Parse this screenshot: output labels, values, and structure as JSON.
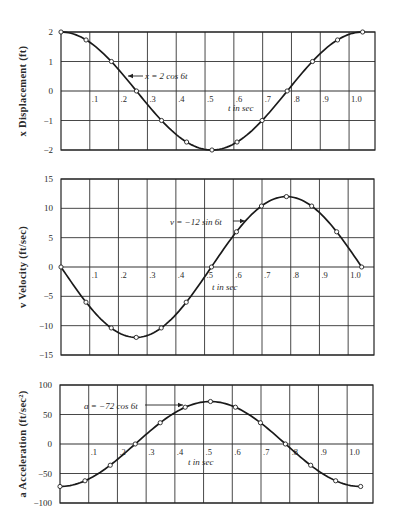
{
  "chart_data": [
    {
      "type": "line",
      "title": "",
      "xlabel": "t in sec",
      "ylabel": "x  Displacement  (ft)",
      "equation": "x = 2 cos 6t",
      "xlim": [
        0,
        1.09
      ],
      "ylim": [
        -2,
        2
      ],
      "x_ticks": [
        ".1",
        ".2",
        ".3",
        ".4",
        ".5",
        ".6",
        ".7",
        ".8",
        ".9",
        "1.0"
      ],
      "y_ticks": [
        "2",
        "1",
        "0",
        "−1",
        "−2"
      ],
      "y_tick_values": [
        2,
        1,
        0,
        -1,
        -2
      ],
      "grid": true,
      "series": [
        {
          "name": "x = 2 cos 6t",
          "x": [
            0,
            0.087,
            0.175,
            0.262,
            0.349,
            0.436,
            0.524,
            0.611,
            0.698,
            0.785,
            0.873,
            0.96,
            1.047
          ],
          "y": [
            2.0,
            1.73,
            1.0,
            0.0,
            -1.0,
            -1.73,
            -2.0,
            -1.73,
            -1.0,
            0.0,
            1.0,
            1.73,
            2.0
          ]
        }
      ],
      "annotation": {
        "text": "x = 2 cos 6t",
        "arrow_to_t": 0.22
      }
    },
    {
      "type": "line",
      "title": "",
      "xlabel": "t in sec",
      "ylabel": "v  Velocity  (ft/sec)",
      "equation": "v = −12 sin 6t",
      "xlim": [
        0,
        1.09
      ],
      "ylim": [
        -15,
        15
      ],
      "x_ticks": [
        ".1",
        ".2",
        ".3",
        ".4",
        ".5",
        ".6",
        ".7",
        ".8",
        ".9",
        "1.0"
      ],
      "y_ticks": [
        "15",
        "10",
        "5",
        "0",
        "−5",
        "−10",
        "−15"
      ],
      "y_tick_values": [
        15,
        10,
        5,
        0,
        -5,
        -10,
        -15
      ],
      "grid": true,
      "series": [
        {
          "name": "v = −12 sin 6t",
          "x": [
            0,
            0.087,
            0.175,
            0.262,
            0.349,
            0.436,
            0.524,
            0.611,
            0.698,
            0.785,
            0.873,
            0.96,
            1.047
          ],
          "y": [
            0.0,
            -6.0,
            -10.39,
            -12.0,
            -10.39,
            -6.0,
            0.0,
            6.0,
            10.39,
            12.0,
            10.39,
            6.0,
            0.0
          ]
        }
      ],
      "annotation": {
        "text": "v = −12 sin 6t",
        "arrow_to_t": 0.6
      }
    },
    {
      "type": "line",
      "title": "",
      "xlabel": "t in sec",
      "ylabel": "a  Acceleration  (ft/sec²)",
      "equation": "a = −72 cos 6t",
      "xlim": [
        0,
        1.09
      ],
      "ylim": [
        -100,
        100
      ],
      "x_ticks": [
        ".1",
        ".2",
        ".3",
        ".4",
        ".5",
        ".6",
        ".7",
        ".8",
        ".9",
        "1.0"
      ],
      "y_ticks": [
        "100",
        "50",
        "0",
        "−50",
        "−100"
      ],
      "y_tick_values": [
        100,
        50,
        0,
        -50,
        -100
      ],
      "grid": true,
      "series": [
        {
          "name": "a = −72 cos 6t",
          "x": [
            0,
            0.087,
            0.175,
            0.262,
            0.349,
            0.436,
            0.524,
            0.611,
            0.698,
            0.785,
            0.873,
            0.96,
            1.047
          ],
          "y": [
            -72.0,
            -62.35,
            -36.0,
            0.0,
            36.0,
            62.35,
            72.0,
            62.35,
            36.0,
            0.0,
            -36.0,
            -62.35,
            -72.0
          ]
        }
      ],
      "annotation": {
        "text": "a = −72 cos 6t",
        "arrow_to_t": 0.43
      }
    }
  ],
  "panels": [
    {
      "id": "displacement",
      "frame": {
        "left": 61,
        "top": 32,
        "right": 375,
        "bottom": 150
      },
      "xlabel_pos": {
        "x": 228,
        "y": 111
      },
      "anno_pos": {
        "x": 145,
        "y": 79,
        "arrow_from": 143,
        "arrow_to": 128,
        "arrow_y": 76
      }
    },
    {
      "id": "velocity",
      "frame": {
        "left": 61,
        "top": 179,
        "right": 374,
        "bottom": 355
      },
      "xlabel_pos": {
        "x": 212,
        "y": 290
      },
      "anno_pos": {
        "x": 170,
        "y": 225,
        "arrow_from": 233,
        "arrow_to": 245,
        "arrow_y": 221
      }
    },
    {
      "id": "acceleration",
      "frame": {
        "left": 60,
        "top": 385,
        "right": 373,
        "bottom": 503
      },
      "xlabel_pos": {
        "x": 188,
        "y": 465
      },
      "anno_pos": {
        "x": 84,
        "y": 409,
        "arrow_from": 145,
        "arrow_to": 183,
        "arrow_y": 405
      }
    }
  ]
}
